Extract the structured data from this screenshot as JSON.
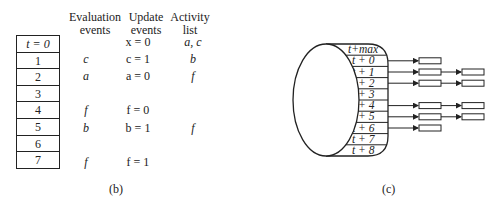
{
  "panel_b": {
    "caption": "(b)",
    "headers": {
      "evaluation": [
        "Evaluation",
        "events"
      ],
      "update": [
        "Update",
        "events"
      ],
      "activity": [
        "Activity",
        "list"
      ]
    },
    "time_slots": [
      "t = 0",
      "1",
      "2",
      "3",
      "4",
      "5",
      "6",
      "7"
    ],
    "rows": [
      {
        "eval": "",
        "update": "x = 0",
        "activity": "a, c"
      },
      {
        "eval": "c",
        "update": "c = 1",
        "activity": "b"
      },
      {
        "eval": "a",
        "update": "a = 0",
        "activity": "f"
      },
      {
        "eval": "",
        "update": "",
        "activity": ""
      },
      {
        "eval": "f",
        "update": "f = 0",
        "activity": ""
      },
      {
        "eval": "b",
        "update": "b = 1",
        "activity": "f"
      },
      {
        "eval": "",
        "update": "",
        "activity": ""
      },
      {
        "eval": "f",
        "update": "f = 1",
        "activity": ""
      }
    ]
  },
  "panel_c": {
    "caption": "(c)",
    "slots": [
      "t+max",
      "t + 0",
      "t + 1",
      "t + 2",
      "t + 3",
      "t + 4",
      "t + 5",
      "t + 6",
      "t + 7",
      "t + 8"
    ],
    "event_counts": [
      0,
      1,
      2,
      2,
      0,
      2,
      2,
      1,
      0,
      0
    ]
  }
}
